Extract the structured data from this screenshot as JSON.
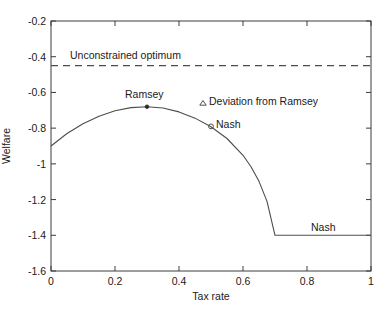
{
  "chart_data": {
    "type": "line",
    "title": "",
    "xlabel": "Tax rate",
    "ylabel": "Welfare",
    "xlim": [
      0,
      1
    ],
    "ylim": [
      -1.6,
      -0.2
    ],
    "grid": false,
    "xticks": [
      "0",
      "0.2",
      "0.4",
      "0.6",
      "0.8",
      "1"
    ],
    "xtick_values": [
      0,
      0.2,
      0.4,
      0.6,
      0.8,
      1
    ],
    "yticks": [
      "-0.2",
      "-0.4",
      "-0.6",
      "-0.8",
      "-1",
      "-1.2",
      "-1.4",
      "-1.6"
    ],
    "ytick_values": [
      -0.2,
      -0.4,
      -0.6,
      -0.8,
      -1.0,
      -1.2,
      -1.4,
      -1.6
    ],
    "series": [
      {
        "name": "Deviation from Ramsey",
        "style": "solid",
        "color": "#4d4d4d",
        "x": [
          0.0,
          0.05,
          0.1,
          0.15,
          0.2,
          0.25,
          0.3,
          0.35,
          0.4,
          0.45,
          0.5,
          0.55,
          0.6,
          0.625,
          0.65,
          0.675,
          0.7,
          0.75,
          0.8,
          0.85,
          0.9,
          0.95,
          1.0
        ],
        "y": [
          -0.9,
          -0.83,
          -0.775,
          -0.733,
          -0.703,
          -0.685,
          -0.68,
          -0.687,
          -0.709,
          -0.744,
          -0.792,
          -0.858,
          -0.952,
          -1.016,
          -1.098,
          -1.21,
          -1.4,
          -1.4,
          -1.4,
          -1.4,
          -1.4,
          -1.4,
          -1.4
        ]
      },
      {
        "name": "Unconstrained optimum",
        "style": "dashed",
        "color": "#4d4d4d",
        "x": [
          0,
          1
        ],
        "y": [
          -0.45,
          -0.45
        ]
      }
    ],
    "markers": [
      {
        "name": "Ramsey",
        "shape": "dot",
        "x": 0.3,
        "y": -0.68
      },
      {
        "name": "Nash",
        "shape": "circle",
        "x": 0.5,
        "y": -0.79
      }
    ],
    "annotations": [
      {
        "name": "unconstrained-optimum-label",
        "text": "Unconstrained optimum",
        "x": 0.21,
        "y": -0.395
      },
      {
        "name": "ramsey-label",
        "text": "Ramsey",
        "x": 0.3,
        "y": -0.625
      },
      {
        "name": "legend-label",
        "text": "Deviation from Ramsey",
        "x": 0.505,
        "y": -0.638
      },
      {
        "name": "nash-curve-label",
        "text": "Nash",
        "x": 0.545,
        "y": -0.783
      },
      {
        "name": "nash-flat-label",
        "text": "Nash",
        "x": 0.855,
        "y": -1.353
      }
    ],
    "legend": {
      "marker": "triangle",
      "label": "Deviation from Ramsey",
      "position": "inside-upper-right"
    }
  },
  "axes": {
    "y_title": "Welfare",
    "x_title": "Tax rate",
    "ytick_labels": [
      "-0.2",
      "-0.4",
      "-0.6",
      "-0.8",
      "-1",
      "-1.2",
      "-1.4",
      "-1.6"
    ],
    "xtick_labels": [
      "0",
      "0.2",
      "0.4",
      "0.6",
      "0.8",
      "1"
    ]
  },
  "labels": {
    "unconstrained_optimum": "Unconstrained optimum",
    "ramsey": "Ramsey",
    "deviation_from_ramsey": "Deviation from Ramsey",
    "nash_curve": "Nash",
    "nash_flat": "Nash"
  },
  "colors": {
    "line": "#4d4d4d",
    "axis": "#3c3c3c",
    "text": "#1a1a1a",
    "background": "#ffffff"
  }
}
